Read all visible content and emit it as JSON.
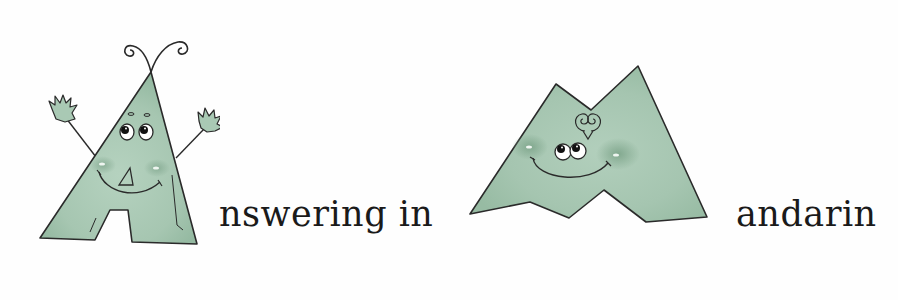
{
  "title": {
    "part1": {
      "initial_letter": "A",
      "rest": "nswering in"
    },
    "part2": {
      "initial_letter": "M",
      "rest": "andarin"
    }
  },
  "illustrations": [
    {
      "letter": "A",
      "character": "cartoon-letter-a-with-antennae-waving-hands"
    },
    {
      "letter": "M",
      "character": "cartoon-letter-m-with-smiling-face"
    }
  ],
  "colors": {
    "letter_fill": "#a9c9b4",
    "letter_shade": "#8fb59d",
    "outline": "#2a2a2a",
    "text": "#1a1a1a",
    "background": "#fefefe"
  }
}
